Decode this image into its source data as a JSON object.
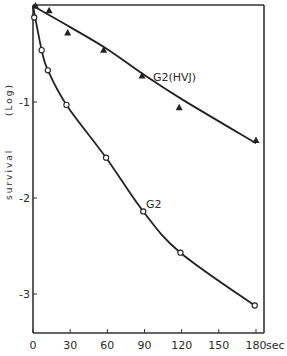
{
  "chart_data": {
    "type": "line",
    "title": "",
    "xlabel": "sec",
    "ylabel": "survival (Log)",
    "xlim": [
      0,
      180
    ],
    "ylim": [
      -3.4,
      0
    ],
    "xticks": [
      0,
      30,
      60,
      90,
      120,
      150,
      180
    ],
    "xtick_labels": [
      "0",
      "30",
      "60",
      "90",
      "120",
      "150",
      "180"
    ],
    "yticks": [
      -1,
      -2,
      -3
    ],
    "ytick_labels": [
      "-1",
      "-2",
      "-3"
    ],
    "grid": false,
    "legend": "inline labels",
    "series": [
      {
        "name": "G2(HVJ)",
        "marker": "filled-triangle",
        "x": [
          2,
          13,
          28,
          57,
          88,
          118,
          180
        ],
        "y": [
          0.0,
          -0.05,
          -0.28,
          -0.46,
          -0.73,
          -1.06,
          -1.4
        ]
      },
      {
        "name": "G2",
        "marker": "open-circle",
        "x": [
          1,
          7,
          12,
          27,
          59,
          89,
          119,
          179
        ],
        "y": [
          -0.12,
          -0.46,
          -0.67,
          -1.03,
          -1.58,
          -2.14,
          -2.57,
          -3.12
        ]
      }
    ]
  },
  "labels": {
    "x_unit": "sec",
    "y_title_word": "survival",
    "y_title_scale": "(Log)",
    "series_hvj": "G2(HVJ)",
    "series_g2": "G2"
  }
}
